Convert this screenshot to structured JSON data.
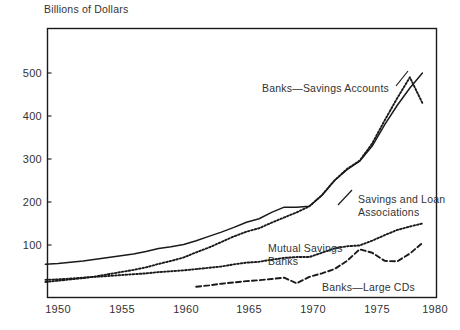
{
  "chart_data": {
    "type": "line",
    "title": "Billions of Dollars",
    "xlabel": "",
    "ylabel": "Billions of Dollars",
    "xlim": [
      1949,
      1979.5
    ],
    "ylim": [
      0,
      560
    ],
    "grid": false,
    "legend_position": "inline-annotations",
    "xticks": [
      "1950",
      "1955",
      "1960",
      "1965",
      "1970",
      "1975",
      "1980"
    ],
    "xtick_values": [
      1950,
      1955,
      1960,
      1965,
      1970,
      1975,
      1980
    ],
    "yticks": [
      "100",
      "200",
      "300",
      "400",
      "500"
    ],
    "ytick_values": [
      100,
      200,
      300,
      400,
      500
    ],
    "series": [
      {
        "name": "Banks—Savings Accounts",
        "style": "solid",
        "label_x": 1966.6,
        "label_y": 432,
        "x": [
          1949,
          1950,
          1951,
          1952,
          1953,
          1954,
          1955,
          1956,
          1957,
          1958,
          1959,
          1960,
          1961,
          1962,
          1963,
          1964,
          1965,
          1966,
          1967,
          1968,
          1969,
          1970,
          1971,
          1972,
          1973,
          1974,
          1975,
          1976,
          1977,
          1978,
          1979
        ],
        "values": [
          55,
          57,
          60,
          63,
          67,
          71,
          75,
          79,
          85,
          92,
          96,
          101,
          110,
          120,
          130,
          141,
          153,
          161,
          176,
          188,
          188,
          190,
          215,
          250,
          275,
          295,
          330,
          380,
          425,
          465,
          500
        ]
      },
      {
        "name": "Savings and Loan Associations",
        "style": "dotted",
        "label_x": 1973.2,
        "label_y": 215,
        "label_line_2_y": 196,
        "x": [
          1949,
          1950,
          1951,
          1952,
          1953,
          1954,
          1955,
          1956,
          1957,
          1958,
          1959,
          1960,
          1961,
          1962,
          1963,
          1964,
          1965,
          1966,
          1967,
          1968,
          1969,
          1970,
          1971,
          1972,
          1973,
          1974,
          1975,
          1976,
          1977,
          1978,
          1979
        ],
        "values": [
          14,
          17,
          20,
          23,
          27,
          32,
          37,
          42,
          48,
          56,
          63,
          71,
          83,
          94,
          107,
          120,
          131,
          139,
          152,
          164,
          176,
          190,
          216,
          250,
          277,
          296,
          336,
          390,
          442,
          490,
          430
        ]
      },
      {
        "name": "Mutual Savings Banks",
        "style": "dotted",
        "label_x": 1963.0,
        "label_y": 112,
        "label_line_2_y": 94,
        "x": [
          1949,
          1950,
          1951,
          1952,
          1953,
          1954,
          1955,
          1956,
          1957,
          1958,
          1959,
          1960,
          1961,
          1962,
          1963,
          1964,
          1965,
          1966,
          1967,
          1968,
          1969,
          1970,
          1971,
          1972,
          1973,
          1974,
          1975,
          1976,
          1977,
          1978,
          1979
        ],
        "values": [
          19,
          20,
          22,
          24,
          26,
          28,
          30,
          32,
          34,
          37,
          39,
          41,
          44,
          47,
          50,
          55,
          59,
          61,
          66,
          70,
          72,
          72,
          82,
          92,
          97,
          99,
          110,
          123,
          135,
          143,
          150
        ]
      },
      {
        "name": "Banks—Large CDs",
        "style": "dashed",
        "label_x": 1970.8,
        "label_y": 28,
        "x": [
          1961,
          1962,
          1963,
          1964,
          1965,
          1966,
          1967,
          1968,
          1969,
          1970,
          1971,
          1972,
          1973,
          1974,
          1975,
          1976,
          1977,
          1978,
          1979
        ],
        "values": [
          3,
          6,
          10,
          13,
          16,
          18,
          21,
          24,
          11,
          26,
          34,
          44,
          63,
          90,
          82,
          63,
          62,
          80,
          105
        ]
      }
    ],
    "annotations": [
      {
        "text": "Banks—Savings Accounts",
        "series": "Banks—Savings Accounts",
        "leader": true
      },
      {
        "text_line_1": "Savings and Loan",
        "text_line_2": "Associations",
        "series": "Savings and Loan Associations",
        "leader": true
      },
      {
        "text_line_1": "Mutual Savings",
        "text_line_2": "Banks",
        "series": "Mutual Savings Banks",
        "leader": false
      },
      {
        "text": "Banks—Large CDs",
        "series": "Banks—Large CDs",
        "leader": false
      }
    ],
    "colors": {
      "line": "#1a1a1a",
      "axis": "#1a1a1a",
      "text": "#333333",
      "background": "#ffffff"
    }
  },
  "labels": {
    "title": "Billions of Dollars",
    "series_1": "Banks—Savings Accounts",
    "series_2_line_1": "Savings and Loan",
    "series_2_line_2": "Associations",
    "series_3_line_1": "Mutual Savings",
    "series_3_line_2": "Banks",
    "series_4": "Banks—Large CDs",
    "y_0": "100",
    "y_1": "200",
    "y_2": "300",
    "y_3": "400",
    "y_4": "500",
    "x_0": "1950",
    "x_1": "1955",
    "x_2": "1960",
    "x_3": "1965",
    "x_4": "1970",
    "x_5": "1975",
    "x_6": "1980"
  }
}
